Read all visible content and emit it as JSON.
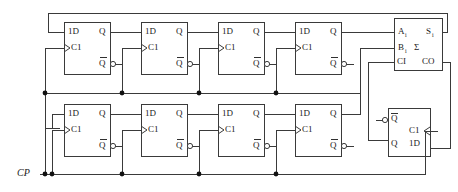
{
  "diagram": {
    "clock_label": "CP",
    "stroke_color": "#3a3a3a",
    "text_color": "#1a1a1a",
    "background": "#ffffff"
  },
  "flipflops": {
    "top": [
      {
        "id": "top-ff-1",
        "data_label": "1D",
        "clock_label": "C1",
        "q_label": "Q",
        "qbar_label": "Q"
      },
      {
        "id": "top-ff-2",
        "data_label": "1D",
        "clock_label": "C1",
        "q_label": "Q",
        "qbar_label": "Q"
      },
      {
        "id": "top-ff-3",
        "data_label": "1D",
        "clock_label": "C1",
        "q_label": "Q",
        "qbar_label": "Q"
      },
      {
        "id": "top-ff-4",
        "data_label": "1D",
        "clock_label": "C1",
        "q_label": "Q",
        "qbar_label": "Q"
      }
    ],
    "bottom": [
      {
        "id": "bot-ff-1",
        "data_label": "1D",
        "clock_label": "C1",
        "q_label": "Q",
        "qbar_label": "Q"
      },
      {
        "id": "bot-ff-2",
        "data_label": "1D",
        "clock_label": "C1",
        "q_label": "Q",
        "qbar_label": "Q"
      },
      {
        "id": "bot-ff-3",
        "data_label": "1D",
        "clock_label": "C1",
        "q_label": "Q",
        "qbar_label": "Q"
      },
      {
        "id": "bot-ff-4",
        "data_label": "1D",
        "clock_label": "C1",
        "q_label": "Q",
        "qbar_label": "Q"
      }
    ],
    "carry": {
      "id": "carry-ff",
      "data_label": "1D",
      "clock_label": "C1",
      "q_label": "Q",
      "qbar_label": "Q"
    }
  },
  "adder": {
    "id": "full-adder",
    "input_a": "A",
    "input_a_sub": "i",
    "input_b": "B",
    "input_b_sub": "i",
    "carry_in": "CI",
    "sum_out": "S",
    "sum_out_sub": "i",
    "sigma": "Σ",
    "carry_out": "CO"
  },
  "ground": {
    "id": "ground-symbol",
    "label": ""
  }
}
